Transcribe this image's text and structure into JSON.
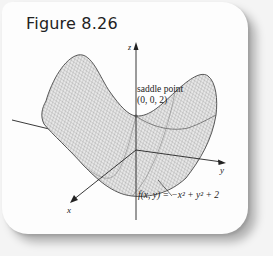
{
  "figure": {
    "title": "Figure 8.26",
    "axes": {
      "x": "x",
      "y": "y",
      "z": "z"
    },
    "annotations": {
      "saddle_label": "saddle point",
      "saddle_coords": "(0, 0, 2)",
      "function": "f(x, y) = −x² + y² + 2"
    }
  },
  "colors": {
    "card": "#fdfdfd",
    "mesh": "#555555",
    "axis": "#222222",
    "shadow": "#9a9a9a"
  }
}
